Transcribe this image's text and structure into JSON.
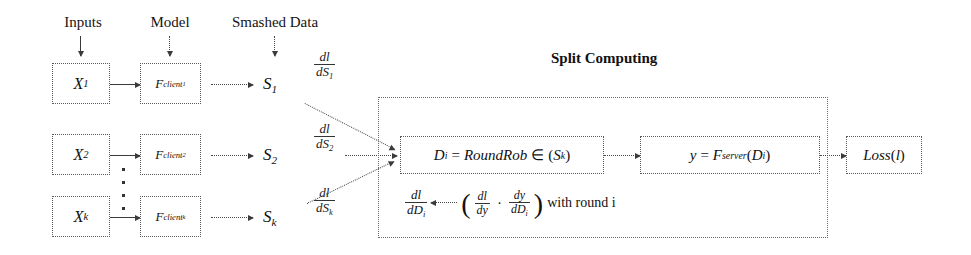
{
  "diagram": {
    "title": "Split Computing",
    "column_headers": [
      {
        "label": "Inputs"
      },
      {
        "label": "Model"
      },
      {
        "label": "Smashed Data"
      }
    ],
    "clients": [
      {
        "input": "X",
        "input_sub": "1",
        "model": "F",
        "model_sub": "client",
        "model_sub2": "1",
        "smashed": "S",
        "smashed_sub": "1",
        "grad_num": "dl",
        "grad_den": "dS",
        "grad_den_sub": "1"
      },
      {
        "input": "X",
        "input_sub": "2",
        "model": "F",
        "model_sub": "client",
        "model_sub2": "2",
        "smashed": "S",
        "smashed_sub": "2",
        "grad_num": "dl",
        "grad_den": "dS",
        "grad_den_sub": "2"
      },
      {
        "input": "X",
        "input_sub": "k",
        "model": "F",
        "model_sub": "client",
        "model_sub2": "k",
        "smashed": "S",
        "smashed_sub": "k",
        "grad_num": "dl",
        "grad_den": "dS",
        "grad_den_sub": "k"
      }
    ],
    "server": {
      "round_robin_box": {
        "lhs": "D",
        "lhs_sub": "i",
        "eq": "=",
        "fn": "RoundRob",
        "op": "∈",
        "arg_open": "(",
        "arg": "S",
        "arg_sub": "k",
        "arg_close": ")"
      },
      "forward_box": {
        "lhs": "y",
        "eq": "=",
        "fn": "F",
        "fn_sub": "server",
        "arg_open": "(",
        "arg": "D",
        "arg_sub": "i",
        "arg_close": ")"
      },
      "loss_box": {
        "fn": "Loss",
        "arg_open": "(",
        "arg": "l",
        "arg_close": ")"
      },
      "backprop": {
        "lhs_num": "dl",
        "lhs_den": "dD",
        "lhs_den_sub": "i",
        "arrow": "←",
        "open_paren": "(",
        "t1_num": "dl",
        "t1_den": "dy",
        "mult": "·",
        "t2_num": "dy",
        "t2_den": "dD",
        "t2_den_sub": "i",
        "close_paren": ")",
        "suffix": "with round i"
      }
    },
    "colors": {
      "ink": "#1a1a1a",
      "border": "#5a5a5a",
      "background": "#ffffff"
    }
  }
}
